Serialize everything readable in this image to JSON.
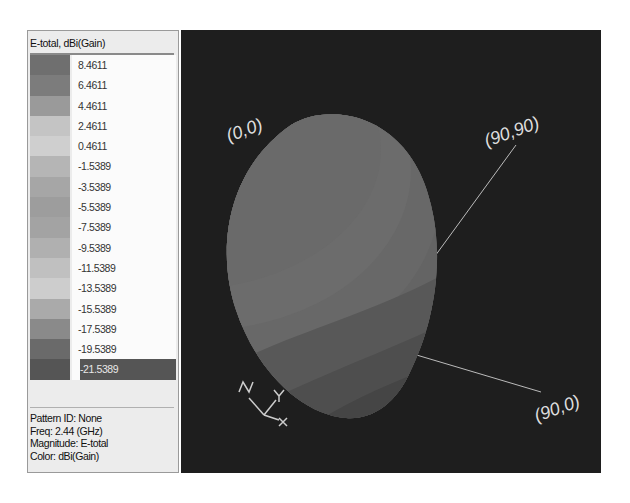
{
  "legend": {
    "title": "E-total, dBi(Gain)",
    "items": [
      {
        "value": "8.4611",
        "color": "#6f6f6f"
      },
      {
        "value": "6.4611",
        "color": "#7c7c7c"
      },
      {
        "value": "4.4611",
        "color": "#9a9a9a"
      },
      {
        "value": "2.4611",
        "color": "#c4c4c4"
      },
      {
        "value": "0.4611",
        "color": "#cfcfcf"
      },
      {
        "value": "-1.5389",
        "color": "#b5b5b5"
      },
      {
        "value": "-3.5389",
        "color": "#a6a6a6"
      },
      {
        "value": "-5.5389",
        "color": "#9d9d9d"
      },
      {
        "value": "-7.5389",
        "color": "#a3a3a3"
      },
      {
        "value": "-9.5389",
        "color": "#b0b0b0"
      },
      {
        "value": "-11.5389",
        "color": "#c0c0c0"
      },
      {
        "value": "-13.5389",
        "color": "#cdcdcd"
      },
      {
        "value": "-15.5389",
        "color": "#aaaaaa"
      },
      {
        "value": "-17.5389",
        "color": "#8a8a8a"
      },
      {
        "value": "-19.5389",
        "color": "#6a6a6a"
      },
      {
        "value": "-21.5389",
        "color": "#555555",
        "selected": true
      }
    ]
  },
  "info": {
    "pattern_id": "Pattern ID: None",
    "freq": "Freq: 2.44 (GHz)",
    "magnitude": "Magnitude: E-total",
    "color": "Color: dBi(Gain)"
  },
  "view3d": {
    "background": "#1e1e1e",
    "labels": {
      "origin": "(0,0)",
      "ninety_ninety": "(90,90)",
      "ninety_zero": "(90,0)"
    },
    "axes_triad": {
      "x": "X",
      "y": "Y",
      "z": "Z"
    }
  }
}
